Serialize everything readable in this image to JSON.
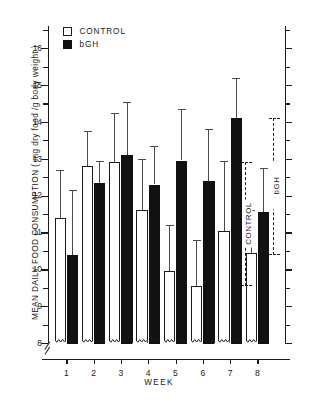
{
  "chart_data": {
    "type": "bar",
    "title": "",
    "xlabel": "WEEK",
    "ylabel": "MEAN  DAILY  FOOD  CONSUMPTION   ( mg dry food /g body weight )",
    "categories": [
      "1",
      "2",
      "3",
      "4",
      "5",
      "6",
      "7",
      "8"
    ],
    "ylim": [
      8,
      16.6
    ],
    "yticks_major": [
      8,
      9,
      10,
      11,
      12,
      13,
      14,
      15,
      16
    ],
    "yticks_minor": [
      8.5,
      9.5,
      10.5,
      11.5,
      12.5,
      13.5,
      14.5,
      15.5,
      16.5
    ],
    "ytick_labels": [
      "8",
      "9",
      "10",
      "11",
      "12",
      "13",
      "14",
      "15",
      "16"
    ],
    "axis_break": true,
    "grid": false,
    "legend_position": "top-left",
    "series": [
      {
        "name": "CONTROL",
        "style": "open",
        "values": [
          11.4,
          12.8,
          12.9,
          11.6,
          9.95,
          9.55,
          11.05,
          10.45
        ],
        "err_top": [
          12.7,
          13.75,
          14.25,
          13.0,
          11.2,
          10.8,
          12.95,
          11.6
        ]
      },
      {
        "name": "bGH",
        "style": "filled",
        "values": [
          10.4,
          12.35,
          13.1,
          12.3,
          12.95,
          12.4,
          14.1,
          11.55
        ],
        "err_top": [
          12.15,
          12.95,
          14.55,
          13.35,
          14.35,
          13.8,
          15.2,
          12.75
        ]
      }
    ],
    "annotations": [
      {
        "label": "CONTROL",
        "kind": "range-bracket",
        "from": 9.55,
        "to": 12.9
      },
      {
        "label": "bGH",
        "kind": "range-bracket",
        "from": 10.4,
        "to": 14.1
      }
    ]
  },
  "legend": {
    "items": [
      {
        "label": "CONTROL",
        "marker": "open-square",
        "color": "#ffffff"
      },
      {
        "label": "bGH",
        "marker": "filled-square",
        "color": "#111111"
      }
    ]
  },
  "colors": {
    "control": "#ffffff",
    "bgh": "#111111",
    "axis": "#1a1a1a",
    "error": "#4a4a4a"
  }
}
